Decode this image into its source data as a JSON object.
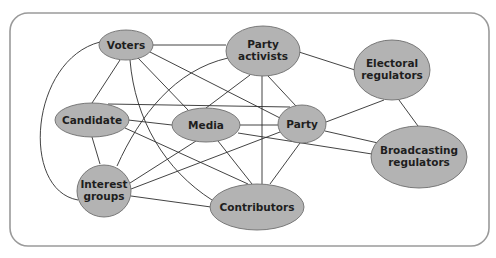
{
  "diagram": {
    "type": "network",
    "colors": {
      "node_fill": "#b3b3b3",
      "node_stroke": "#6e6e6e",
      "edge": "#2e2e2e",
      "frame": "#9a9a9a"
    },
    "nodes": {
      "voters": {
        "lines": [
          "Voters"
        ]
      },
      "party_activists": {
        "lines": [
          "Party",
          "activists"
        ]
      },
      "electoral_regulators": {
        "lines": [
          "Electoral",
          "regulators"
        ]
      },
      "candidate": {
        "lines": [
          "Candidate"
        ]
      },
      "media": {
        "lines": [
          "Media"
        ]
      },
      "party": {
        "lines": [
          "Party"
        ]
      },
      "broadcasting_regulators": {
        "lines": [
          "Broadcasting",
          "regulators"
        ]
      },
      "interest_groups": {
        "lines": [
          "Interest",
          "groups"
        ]
      },
      "contributors": {
        "lines": [
          "Contributors"
        ]
      }
    },
    "edges": [
      [
        "Voters",
        "Party activists"
      ],
      [
        "Voters",
        "Candidate"
      ],
      [
        "Voters",
        "Interest groups"
      ],
      [
        "Voters",
        "Media"
      ],
      [
        "Voters",
        "Party"
      ],
      [
        "Voters",
        "Contributors"
      ],
      [
        "Party activists",
        "Electoral regulators"
      ],
      [
        "Party activists",
        "Interest groups"
      ],
      [
        "Party activists",
        "Media"
      ],
      [
        "Party activists",
        "Party"
      ],
      [
        "Party activists",
        "Contributors"
      ],
      [
        "Candidate",
        "Party"
      ],
      [
        "Candidate",
        "Media"
      ],
      [
        "Candidate",
        "Interest groups"
      ],
      [
        "Candidate",
        "Contributors"
      ],
      [
        "Media",
        "Party"
      ],
      [
        "Media",
        "Broadcasting regulators"
      ],
      [
        "Media",
        "Interest groups"
      ],
      [
        "Media",
        "Contributors"
      ],
      [
        "Interest groups",
        "Party"
      ],
      [
        "Interest groups",
        "Contributors"
      ],
      [
        "Party",
        "Electoral regulators"
      ],
      [
        "Party",
        "Broadcasting regulators"
      ],
      [
        "Party",
        "Contributors"
      ],
      [
        "Electoral regulators",
        "Broadcasting regulators"
      ]
    ]
  }
}
